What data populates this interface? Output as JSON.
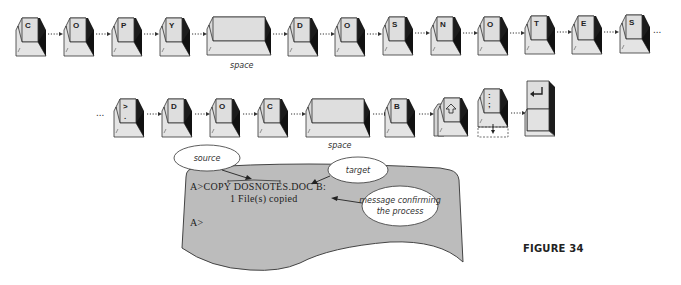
{
  "figure": {
    "label": "FIGURE 34"
  },
  "row1": {
    "keys": [
      {
        "label": "C",
        "type": "letter"
      },
      {
        "label": "O",
        "type": "letter"
      },
      {
        "label": "P",
        "type": "letter"
      },
      {
        "label": "Y",
        "type": "letter"
      },
      {
        "label": "",
        "type": "space",
        "caption": "space"
      },
      {
        "label": "D",
        "type": "letter"
      },
      {
        "label": "O",
        "type": "letter"
      },
      {
        "label": "S",
        "type": "letter"
      },
      {
        "label": "N",
        "type": "letter"
      },
      {
        "label": "O",
        "type": "letter"
      },
      {
        "label": "T",
        "type": "letter"
      },
      {
        "label": "E",
        "type": "letter"
      },
      {
        "label": "S",
        "type": "letter"
      }
    ],
    "continuation": "..."
  },
  "row2": {
    "leading": "...",
    "keys": [
      {
        "label": ">",
        "type": "letter",
        "sublabel": "."
      },
      {
        "label": "D",
        "type": "letter"
      },
      {
        "label": "O",
        "type": "letter"
      },
      {
        "label": "C",
        "type": "letter"
      },
      {
        "label": "",
        "type": "space",
        "caption": "space"
      },
      {
        "label": "B",
        "type": "letter"
      },
      {
        "label": "shift-arrow",
        "type": "shift"
      },
      {
        "label": ":",
        "type": "colon",
        "sublabel": ";"
      },
      {
        "label": "enter-arrow",
        "type": "enter"
      }
    ]
  },
  "screen": {
    "line1": "A>COPY DOSNOTES.DOC B:",
    "line1_prefix": "A>COPY ",
    "line1_source": "DOSNOTES.DOC",
    "line1_target": " B:",
    "line2": "1 File(s) copied",
    "line3": "A>",
    "background": "#bdbdbd"
  },
  "callouts": {
    "source": "source",
    "target": "target",
    "message_line1": "message confirming",
    "message_line2": "the process"
  }
}
